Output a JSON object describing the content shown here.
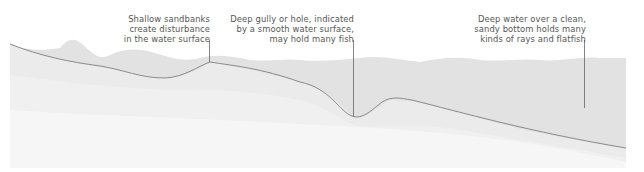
{
  "diagram": {
    "annotations": [
      {
        "id": "sandbanks",
        "text": "Shallow sandbanks\ncreate disturbance\nin the water surface"
      },
      {
        "id": "gully",
        "text": "Deep gully or hole, indicated\nby a smooth water surface,\nmay hold many fish"
      },
      {
        "id": "deep",
        "text": "Deep water over a clean,\nsandy bottom holds many\nkinds of rays and flatfish"
      }
    ],
    "colors": {
      "background": "#ffffff",
      "water_surface": "#dcdcdc",
      "water_body": "#e6e6e6",
      "seabed_band_1": "#eeeeee",
      "seabed_band_2": "#f3f3f3",
      "seabed_band_3": "#f8f8f8",
      "seabed_line": "#8a8a8a",
      "leader_line": "#666666",
      "text": "#555555"
    }
  }
}
